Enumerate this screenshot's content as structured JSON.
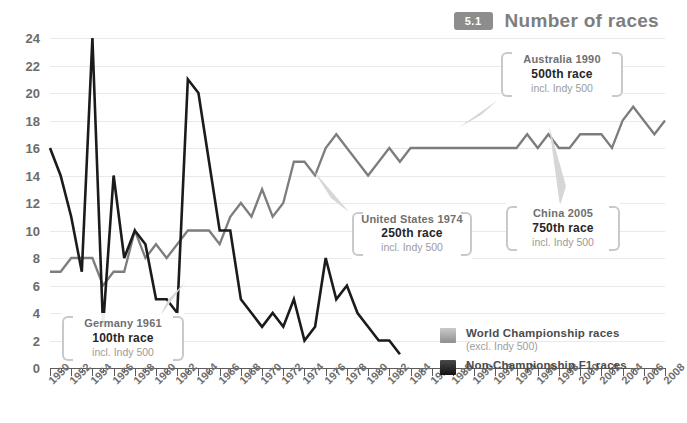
{
  "header": {
    "section_badge": "5.1",
    "title": "Number of races"
  },
  "legend": {
    "items": [
      {
        "label": "World Championship races",
        "sublabel": "(excl. Indy 500)",
        "color": "#9a9a9a"
      },
      {
        "label": "Non-Championship F1 races",
        "sublabel": "",
        "color": "#1e1e1e"
      }
    ]
  },
  "callouts": [
    {
      "name": "germany-1961",
      "line1": "Germany 1961",
      "line2": "100th race",
      "line3": "incl. Indy 500"
    },
    {
      "name": "united-states-1974",
      "line1": "United States 1974",
      "line2": "250th race",
      "line3": "incl. Indy 500"
    },
    {
      "name": "australia-1990",
      "line1": "Australia 1990",
      "line2": "500th race",
      "line3": "incl. Indy 500"
    },
    {
      "name": "china-2005",
      "line1": "China 2005",
      "line2": "750th race",
      "line3": "incl. Indy 500"
    }
  ],
  "chart_data": {
    "type": "line",
    "title": "Number of races",
    "xlabel": "",
    "ylabel": "",
    "xlim": [
      1950,
      2008
    ],
    "ylim": [
      0,
      24
    ],
    "ytick_step": 2,
    "xtick_step": 2,
    "xtick_minor_step": 1,
    "grid": true,
    "legend_position": "bottom-right",
    "yticks": [
      0,
      2,
      4,
      6,
      8,
      10,
      12,
      14,
      16,
      18,
      20,
      22,
      24
    ],
    "xticks": [
      1950,
      1952,
      1954,
      1956,
      1958,
      1960,
      1962,
      1964,
      1966,
      1968,
      1970,
      1972,
      1974,
      1976,
      1978,
      1980,
      1982,
      1984,
      1986,
      1988,
      1990,
      1992,
      1994,
      1996,
      1998,
      2000,
      2002,
      2004,
      2006,
      2008
    ],
    "x": [
      1950,
      1951,
      1952,
      1953,
      1954,
      1955,
      1956,
      1957,
      1958,
      1959,
      1960,
      1961,
      1962,
      1963,
      1964,
      1965,
      1966,
      1967,
      1968,
      1969,
      1970,
      1971,
      1972,
      1973,
      1974,
      1975,
      1976,
      1977,
      1978,
      1979,
      1980,
      1981,
      1982,
      1983,
      1984,
      1985,
      1986,
      1987,
      1988,
      1989,
      1990,
      1991,
      1992,
      1993,
      1994,
      1995,
      1996,
      1997,
      1998,
      1999,
      2000,
      2001,
      2002,
      2003,
      2004,
      2005,
      2006,
      2007,
      2008
    ],
    "series": [
      {
        "name": "World Championship races",
        "sublabel": "(excl. Indy 500)",
        "color": "#7d7d7d",
        "values": [
          7,
          7,
          8,
          8,
          8,
          6,
          7,
          7,
          10,
          8,
          9,
          8,
          9,
          10,
          10,
          10,
          9,
          11,
          12,
          11,
          13,
          11,
          12,
          15,
          15,
          14,
          16,
          17,
          16,
          15,
          14,
          15,
          16,
          15,
          16,
          16,
          16,
          16,
          16,
          16,
          16,
          16,
          16,
          16,
          16,
          17,
          16,
          17,
          16,
          16,
          17,
          17,
          17,
          16,
          18,
          19,
          18,
          17,
          18
        ]
      },
      {
        "name": "Non-Championship F1 races",
        "color": "#1b1b1b",
        "values": [
          16,
          14,
          11,
          7,
          24,
          3,
          14,
          8,
          10,
          9,
          5,
          5,
          4,
          21,
          20,
          15,
          10,
          10,
          5,
          4,
          3,
          4,
          3,
          5,
          2,
          3,
          8,
          5,
          6,
          4,
          3,
          2,
          2,
          1,
          0,
          0,
          0,
          0,
          0,
          0,
          0,
          0,
          0,
          0,
          0,
          0,
          0,
          0,
          0,
          0,
          0,
          0,
          0,
          0,
          0,
          0,
          0,
          0,
          0
        ]
      }
    ],
    "nonchamp_last_year": 1983
  }
}
